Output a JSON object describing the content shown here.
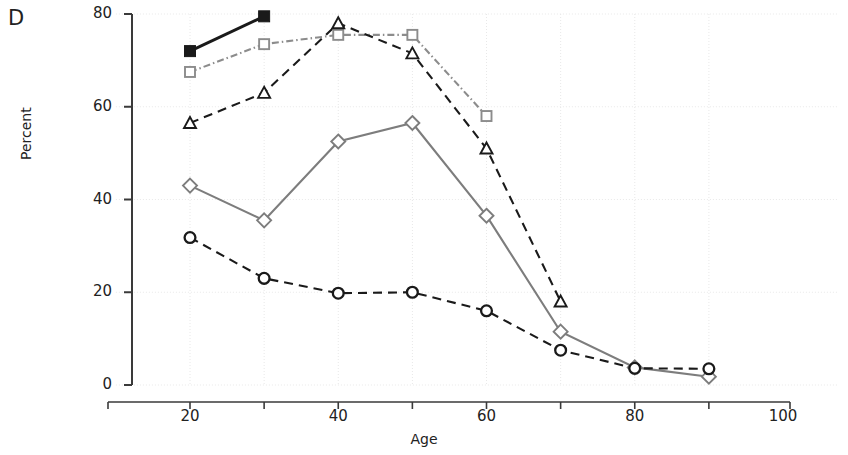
{
  "panel": {
    "label": "D"
  },
  "axes": {
    "x": {
      "title": "Age",
      "min": 10,
      "max": 100,
      "ticks": [
        20,
        40,
        60,
        80,
        100
      ],
      "minor_ticks": [
        10,
        30,
        50,
        70,
        90
      ],
      "tick_labels": [
        "20",
        "40",
        "60",
        "80",
        "100"
      ]
    },
    "y": {
      "title": "Percent",
      "min": 0,
      "max": 80,
      "ticks": [
        0,
        20,
        40,
        60,
        80
      ],
      "tick_labels": [
        "0",
        "20",
        "40",
        "60",
        "80"
      ]
    },
    "grid": "light dotted horizontal and vertical"
  },
  "colors": {
    "series_black": "#1a1a1a",
    "series_gray": "#7d7d7d",
    "grid": "#e8e8e8",
    "axis": "#3a3a3a",
    "background": "#ffffff"
  },
  "chart_data": {
    "type": "line",
    "title": "",
    "subtitle": "",
    "xlabel": "Age",
    "ylabel": "Percent",
    "xlim": [
      10,
      100
    ],
    "ylim": [
      0,
      80
    ],
    "xticks": [
      20,
      40,
      60,
      80,
      100
    ],
    "yticks": [
      0,
      20,
      40,
      60,
      80
    ],
    "grid": true,
    "legend": "none",
    "annotations": [
      "D"
    ],
    "series": [
      {
        "name": "filled-square-solid",
        "marker": "filled-square",
        "line_style": "solid",
        "color": "#1a1a1a",
        "x": [
          20,
          30
        ],
        "values": [
          72.0,
          79.5
        ]
      },
      {
        "name": "open-square-dashdot",
        "marker": "open-square",
        "line_style": "dashdot",
        "color": "#8c8c8c",
        "x": [
          20,
          30,
          40,
          50,
          60
        ],
        "values": [
          67.5,
          73.5,
          75.5,
          75.5,
          58.0
        ]
      },
      {
        "name": "open-triangle-dashed",
        "marker": "open-triangle",
        "line_style": "dashed",
        "color": "#1a1a1a",
        "x": [
          20,
          30,
          40,
          50,
          60,
          70
        ],
        "values": [
          56.5,
          63.0,
          78.0,
          71.5,
          51.0,
          18.0
        ]
      },
      {
        "name": "open-diamond-solid",
        "marker": "open-diamond",
        "line_style": "solid",
        "color": "#7d7d7d",
        "x": [
          20,
          30,
          40,
          50,
          60,
          70,
          80,
          90
        ],
        "values": [
          43.0,
          35.5,
          52.5,
          56.5,
          36.5,
          11.5,
          3.8,
          1.8
        ]
      },
      {
        "name": "open-circle-dashed",
        "marker": "open-circle",
        "line_style": "dashed",
        "color": "#1a1a1a",
        "x": [
          20,
          30,
          40,
          50,
          60,
          70,
          80,
          90
        ],
        "values": [
          31.8,
          23.0,
          19.8,
          20.0,
          16.0,
          7.5,
          3.6,
          3.5
        ]
      }
    ]
  }
}
